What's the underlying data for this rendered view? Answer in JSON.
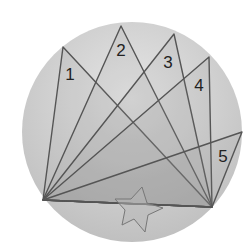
{
  "diagram": {
    "background": "#ffffff",
    "disc": {
      "cx": 132,
      "cy": 132,
      "r": 110,
      "fill_light": "#e6e6e6",
      "fill_dark": "#bdbdbd"
    },
    "line_color": "#555555",
    "fill_color": "#8a8a8a",
    "vertices": {
      "left": [
        43,
        200
      ],
      "right": [
        212,
        207
      ]
    },
    "triangles": [
      {
        "label": "1",
        "base": "left",
        "apex": [
          63,
          47
        ],
        "label_pos": [
          70,
          80
        ]
      },
      {
        "label": "2",
        "base": "left",
        "apex": [
          121,
          26
        ],
        "label_pos": [
          121,
          56
        ]
      },
      {
        "label": "3",
        "base": "left",
        "apex": [
          174,
          34
        ],
        "label_pos": [
          168,
          68
        ]
      },
      {
        "label": "4",
        "base": "left",
        "apex": [
          209,
          57
        ],
        "label_pos": [
          199,
          91
        ]
      },
      {
        "label": "5",
        "base": "left",
        "apex": [
          242,
          132
        ],
        "label_pos": [
          223,
          162
        ]
      }
    ],
    "star": {
      "points": [
        [
          142,
          187
        ],
        [
          147,
          203
        ],
        [
          163,
          208
        ],
        [
          148,
          215
        ],
        [
          145,
          232
        ],
        [
          134,
          219
        ],
        [
          122,
          225
        ],
        [
          125,
          210
        ],
        [
          115,
          199
        ],
        [
          131,
          199
        ]
      ],
      "stroke": "#777777",
      "fill": "#b5b5b5"
    }
  }
}
